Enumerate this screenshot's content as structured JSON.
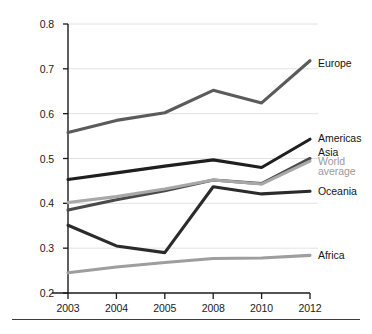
{
  "figure": {
    "name": "multi-series-line-chart",
    "background": "#ffffff",
    "bottom_rule_color": "#3d3d3d"
  },
  "chart_data": {
    "type": "line",
    "title": "",
    "subtitle": "",
    "xlabel": "",
    "ylabel": "",
    "categories": [
      "2003",
      "2004",
      "2005",
      "2008",
      "2010",
      "2012"
    ],
    "ylim": [
      0.2,
      0.8
    ],
    "yticks": [
      0.2,
      0.3,
      0.4,
      0.5,
      0.6,
      0.7,
      0.8
    ],
    "ytick_labels": [
      "0.2",
      "0.3",
      "0.4",
      "0.5",
      "0.6",
      "0.7",
      "0.8"
    ],
    "grid": true,
    "grid_axis": "y",
    "grid_color": "#e2e2e2",
    "axis_color": "#1a1a1a",
    "legend_position": "right-inline-end-of-line",
    "series": [
      {
        "name": "Europe",
        "color": "#5b5b5b",
        "values": [
          0.558,
          0.585,
          0.602,
          0.652,
          0.624,
          0.718
        ],
        "label_y": 0.712
      },
      {
        "name": "Americas",
        "color": "#1f1f1f",
        "values": [
          0.453,
          0.468,
          0.483,
          0.497,
          0.48,
          0.543
        ],
        "label_y": 0.546
      },
      {
        "name": "Asia",
        "color": "#4a4a4a",
        "values": [
          0.385,
          0.408,
          0.428,
          0.452,
          0.444,
          0.5
        ],
        "label_y": 0.515
      },
      {
        "name": "World average",
        "color": "#a8a8a8",
        "values": [
          0.402,
          0.415,
          0.432,
          0.452,
          0.443,
          0.494
        ],
        "label_y": 0.484,
        "label_lines": [
          "World",
          "average"
        ],
        "muted": true
      },
      {
        "name": "Oceania",
        "color": "#2b2b2b",
        "values": [
          0.351,
          0.305,
          0.29,
          0.437,
          0.421,
          0.427
        ],
        "label_y": 0.428
      },
      {
        "name": "Africa",
        "color": "#9e9e9e",
        "values": [
          0.245,
          0.258,
          0.268,
          0.277,
          0.278,
          0.284
        ],
        "label_y": 0.285
      }
    ]
  },
  "axis": {
    "y_tick_labels": [
      "0.8",
      "0.7",
      "0.6",
      "0.5",
      "0.4",
      "0.3",
      "0.2"
    ],
    "x_tick_labels": [
      "2003",
      "2004",
      "2005",
      "2008",
      "2010",
      "2012"
    ]
  },
  "legend": {
    "items": [
      {
        "label": "Europe"
      },
      {
        "label": "Americas"
      },
      {
        "label": "Asia"
      },
      {
        "label_line1": "World",
        "label_line2": "average"
      },
      {
        "label": "Oceania"
      },
      {
        "label": "Africa"
      }
    ]
  }
}
